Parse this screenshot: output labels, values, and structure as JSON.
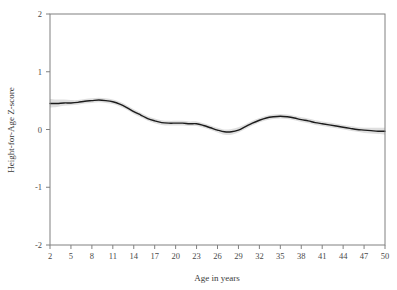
{
  "chart_data": {
    "type": "line",
    "title": "",
    "subtitle": "",
    "xlabel": "Age in years",
    "ylabel": "Height-for-Age Z-score",
    "xlim": [
      2,
      50
    ],
    "ylim": [
      -2,
      2
    ],
    "grid": false,
    "legend": null,
    "legend_position": "none",
    "annotations": [],
    "xticks": [
      2,
      5,
      8,
      11,
      14,
      17,
      20,
      23,
      26,
      29,
      32,
      35,
      38,
      41,
      44,
      47,
      50
    ],
    "xtick_labels": [
      "2",
      "5",
      "8",
      "11",
      "14",
      "17",
      "20",
      "23",
      "26",
      "29",
      "32",
      "35",
      "38",
      "41",
      "44",
      "47",
      "50"
    ],
    "yticks": [
      2,
      1,
      0,
      -1,
      -2
    ],
    "ytick_labels": [
      "2",
      "1",
      "0",
      "-1",
      "-2"
    ],
    "colors": {
      "line": "#1c1c1c",
      "confidence_band": "#d9d9d9",
      "axis": "#808080",
      "text": "#3a3a3a",
      "background": "#ffffff"
    },
    "series": [
      {
        "name": "Height-for-Age Z-score (smoothed)",
        "style": "solid-line-with-confidence-band",
        "x": [
          2,
          3,
          4,
          5,
          6,
          7,
          8,
          9,
          10,
          11,
          12,
          13,
          14,
          15,
          16,
          17,
          18,
          19,
          20,
          21,
          22,
          23,
          24,
          25,
          26,
          27,
          28,
          29,
          30,
          31,
          32,
          33,
          34,
          35,
          36,
          37,
          38,
          39,
          40,
          41,
          42,
          43,
          44,
          45,
          46,
          47,
          48,
          49,
          50
        ],
        "values": [
          0.45,
          0.45,
          0.46,
          0.46,
          0.47,
          0.49,
          0.5,
          0.51,
          0.5,
          0.48,
          0.44,
          0.38,
          0.31,
          0.25,
          0.19,
          0.15,
          0.12,
          0.11,
          0.11,
          0.11,
          0.1,
          0.1,
          0.07,
          0.03,
          -0.01,
          -0.04,
          -0.04,
          -0.01,
          0.05,
          0.11,
          0.16,
          0.2,
          0.22,
          0.23,
          0.22,
          0.2,
          0.17,
          0.15,
          0.12,
          0.1,
          0.08,
          0.06,
          0.04,
          0.02,
          0.0,
          -0.01,
          -0.02,
          -0.03,
          -0.03
        ],
        "ci_lower": [
          0.38,
          0.39,
          0.41,
          0.42,
          0.43,
          0.45,
          0.46,
          0.47,
          0.46,
          0.44,
          0.4,
          0.34,
          0.27,
          0.21,
          0.15,
          0.11,
          0.08,
          0.07,
          0.07,
          0.07,
          0.06,
          0.06,
          0.03,
          -0.01,
          -0.05,
          -0.09,
          -0.09,
          -0.05,
          0.01,
          0.07,
          0.12,
          0.16,
          0.18,
          0.19,
          0.18,
          0.16,
          0.13,
          0.11,
          0.08,
          0.06,
          0.04,
          0.02,
          0.0,
          -0.02,
          -0.04,
          -0.06,
          -0.07,
          -0.08,
          -0.09
        ],
        "ci_upper": [
          0.53,
          0.52,
          0.52,
          0.51,
          0.51,
          0.53,
          0.54,
          0.55,
          0.54,
          0.52,
          0.48,
          0.42,
          0.35,
          0.29,
          0.23,
          0.19,
          0.16,
          0.15,
          0.15,
          0.15,
          0.14,
          0.14,
          0.11,
          0.07,
          0.03,
          0.0,
          0.01,
          0.04,
          0.09,
          0.15,
          0.2,
          0.24,
          0.26,
          0.27,
          0.26,
          0.24,
          0.21,
          0.19,
          0.16,
          0.14,
          0.12,
          0.1,
          0.08,
          0.06,
          0.04,
          0.03,
          0.03,
          0.03,
          0.03
        ]
      }
    ]
  },
  "axes": {
    "x_title": "Age in years",
    "y_title": "Height-for-Age Z-score"
  }
}
